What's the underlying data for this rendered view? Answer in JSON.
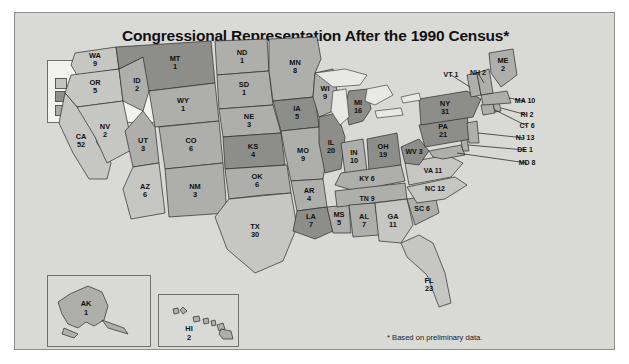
{
  "title": "Congressional Representation After the 1990 Census*",
  "footnote": "* Based on preliminary data.",
  "legend": {
    "heading": "LEGEND",
    "items": [
      {
        "label": "Gained representatives",
        "key": "gain",
        "color": "#c6c6c2"
      },
      {
        "label": "Lost representatives",
        "key": "lost",
        "color": "#8d8d8a"
      },
      {
        "label": "No change",
        "key": "same",
        "color": "#aeaeaa"
      }
    ]
  },
  "insets": [
    {
      "name": "alaska-inset",
      "abbr": "AK",
      "seats": 1
    },
    {
      "name": "hawaii-inset",
      "abbr": "HI",
      "seats": 2
    }
  ],
  "chart_data": {
    "type": "map",
    "title": "Congressional Representation After the 1990 Census*",
    "value_label": "Representatives",
    "categories": [
      "gain",
      "lost",
      "same"
    ],
    "category_labels": {
      "gain": "Gained representatives",
      "lost": "Lost representatives",
      "same": "No change"
    },
    "states": [
      {
        "abbr": "WA",
        "seats": 9,
        "status": "gain"
      },
      {
        "abbr": "OR",
        "seats": 5,
        "status": "gain"
      },
      {
        "abbr": "CA",
        "seats": 52,
        "status": "gain"
      },
      {
        "abbr": "NV",
        "seats": 2,
        "status": "gain"
      },
      {
        "abbr": "ID",
        "seats": 2,
        "status": "same"
      },
      {
        "abbr": "MT",
        "seats": 1,
        "status": "lost"
      },
      {
        "abbr": "WY",
        "seats": 1,
        "status": "same"
      },
      {
        "abbr": "UT",
        "seats": 3,
        "status": "same"
      },
      {
        "abbr": "AZ",
        "seats": 6,
        "status": "gain"
      },
      {
        "abbr": "CO",
        "seats": 6,
        "status": "same"
      },
      {
        "abbr": "NM",
        "seats": 3,
        "status": "same"
      },
      {
        "abbr": "ND",
        "seats": 1,
        "status": "same"
      },
      {
        "abbr": "SD",
        "seats": 1,
        "status": "same"
      },
      {
        "abbr": "NE",
        "seats": 3,
        "status": "same"
      },
      {
        "abbr": "KS",
        "seats": 4,
        "status": "lost"
      },
      {
        "abbr": "OK",
        "seats": 6,
        "status": "same"
      },
      {
        "abbr": "TX",
        "seats": 30,
        "status": "gain"
      },
      {
        "abbr": "MN",
        "seats": 8,
        "status": "same"
      },
      {
        "abbr": "IA",
        "seats": 5,
        "status": "lost"
      },
      {
        "abbr": "MO",
        "seats": 9,
        "status": "same"
      },
      {
        "abbr": "AR",
        "seats": 4,
        "status": "same"
      },
      {
        "abbr": "LA",
        "seats": 7,
        "status": "lost"
      },
      {
        "abbr": "WI",
        "seats": 9,
        "status": "same"
      },
      {
        "abbr": "IL",
        "seats": 20,
        "status": "lost"
      },
      {
        "abbr": "MS",
        "seats": 5,
        "status": "same"
      },
      {
        "abbr": "MI",
        "seats": 16,
        "status": "lost"
      },
      {
        "abbr": "IN",
        "seats": 10,
        "status": "same"
      },
      {
        "abbr": "OH",
        "seats": 19,
        "status": "lost"
      },
      {
        "abbr": "KY",
        "seats": 6,
        "status": "same"
      },
      {
        "abbr": "TN",
        "seats": 9,
        "status": "same"
      },
      {
        "abbr": "AL",
        "seats": 7,
        "status": "same"
      },
      {
        "abbr": "GA",
        "seats": 11,
        "status": "gain"
      },
      {
        "abbr": "FL",
        "seats": 23,
        "status": "gain"
      },
      {
        "abbr": "SC",
        "seats": 6,
        "status": "same"
      },
      {
        "abbr": "NC",
        "seats": 12,
        "status": "gain"
      },
      {
        "abbr": "VA",
        "seats": 11,
        "status": "gain"
      },
      {
        "abbr": "WV",
        "seats": 3,
        "status": "lost"
      },
      {
        "abbr": "MD",
        "seats": 8,
        "status": "same"
      },
      {
        "abbr": "DE",
        "seats": 1,
        "status": "same"
      },
      {
        "abbr": "PA",
        "seats": 21,
        "status": "lost"
      },
      {
        "abbr": "NJ",
        "seats": 13,
        "status": "same"
      },
      {
        "abbr": "NY",
        "seats": 31,
        "status": "lost"
      },
      {
        "abbr": "CT",
        "seats": 6,
        "status": "same"
      },
      {
        "abbr": "RI",
        "seats": 2,
        "status": "same"
      },
      {
        "abbr": "MA",
        "seats": 10,
        "status": "same"
      },
      {
        "abbr": "VT",
        "seats": 1,
        "status": "same"
      },
      {
        "abbr": "NH",
        "seats": 2,
        "status": "same"
      },
      {
        "abbr": "ME",
        "seats": 2,
        "status": "same"
      },
      {
        "abbr": "AK",
        "seats": 1,
        "status": "same"
      },
      {
        "abbr": "HI",
        "seats": 2,
        "status": "same"
      }
    ]
  },
  "state_labels": {
    "WA": "WA",
    "OR": "OR",
    "CA": "CA",
    "NV": "NV",
    "ID": "ID",
    "MT": "MT",
    "WY": "WY",
    "UT": "UT",
    "AZ": "AZ",
    "CO": "CO",
    "NM": "NM",
    "ND": "ND",
    "SD": "SD",
    "NE": "NE",
    "KS": "KS",
    "OK": "OK",
    "TX": "TX",
    "MN": "MN",
    "IA": "IA",
    "MO": "MO",
    "AR": "AR",
    "LA": "LA",
    "WI": "WI",
    "IL": "IL",
    "MS": "MS",
    "MI": "MI",
    "IN": "IN",
    "OH": "OH",
    "KY": "KY",
    "TN": "TN",
    "AL": "AL",
    "GA": "GA",
    "FL": "FL",
    "SC": "SC",
    "NC": "NC",
    "VA": "VA",
    "WV": "WV",
    "MD": "MD",
    "DE": "DE",
    "PA": "PA",
    "NJ": "NJ",
    "NY": "NY",
    "CT": "CT",
    "RI": "RI",
    "MA": "MA",
    "VT": "VT",
    "NH": "NH",
    "ME": "ME",
    "AK": "AK",
    "HI": "HI"
  }
}
